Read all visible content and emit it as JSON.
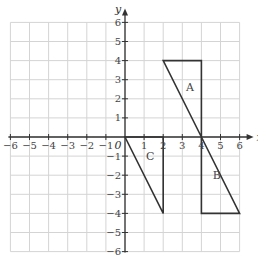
{
  "diagram": {
    "type": "coordinate-grid",
    "x_axis": {
      "label": "x",
      "min": -6,
      "max": 6,
      "ticks": [
        "−6",
        "−5",
        "−4",
        "−3",
        "−2",
        "−1",
        "1",
        "2",
        "3",
        "4",
        "5",
        "6"
      ]
    },
    "y_axis": {
      "label": "y",
      "min": -6,
      "max": 6,
      "ticks": [
        "6",
        "5",
        "4",
        "3",
        "2",
        "1",
        "−1",
        "−2",
        "−3",
        "−4",
        "−5",
        "−6"
      ]
    },
    "origin_label": "0",
    "shapes": [
      {
        "name": "A",
        "vertices": [
          [
            2,
            4
          ],
          [
            4,
            4
          ],
          [
            4,
            0
          ]
        ]
      },
      {
        "name": "B",
        "vertices": [
          [
            4,
            0
          ],
          [
            6,
            -4
          ],
          [
            4,
            -4
          ]
        ]
      },
      {
        "name": "C",
        "vertices": [
          [
            0,
            0
          ],
          [
            2,
            -4
          ],
          [
            2,
            0
          ]
        ]
      }
    ],
    "shape_labels": {
      "A": "A",
      "B": "B",
      "C": "C"
    }
  }
}
